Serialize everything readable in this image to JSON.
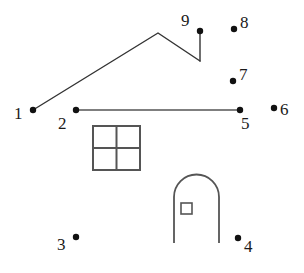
{
  "page": {
    "background_color": "#ffffff",
    "ink_color": "#333333",
    "label_color": "#1a1a1a",
    "width": 304,
    "height": 273
  },
  "dots": [
    {
      "number": "1",
      "cx": 33,
      "cy": 110,
      "r": 3.2,
      "label_x": 14,
      "label_y": 105
    },
    {
      "number": "2",
      "cx": 76,
      "cy": 110,
      "r": 3.2,
      "label_x": 58,
      "label_y": 115
    },
    {
      "number": "3",
      "cx": 76,
      "cy": 237,
      "r": 3.2,
      "label_x": 57,
      "label_y": 236
    },
    {
      "number": "4",
      "cx": 238,
      "cy": 238,
      "r": 3.2,
      "label_x": 244,
      "label_y": 238
    },
    {
      "number": "5",
      "cx": 240,
      "cy": 110,
      "r": 3.2,
      "label_x": 241,
      "label_y": 115
    },
    {
      "number": "6",
      "cx": 274,
      "cy": 108,
      "r": 3.2,
      "label_x": 280,
      "label_y": 101
    },
    {
      "number": "7",
      "cx": 233,
      "cy": 81,
      "r": 3.2,
      "label_x": 239,
      "label_y": 66
    },
    {
      "number": "8",
      "cx": 234,
      "cy": 29,
      "r": 3.2,
      "label_x": 240,
      "label_y": 14
    },
    {
      "number": "9",
      "cx": 200,
      "cy": 31,
      "r": 3.2,
      "label_x": 181,
      "label_y": 12
    }
  ],
  "lines": [
    {
      "name": "roof-line",
      "points": "33,110 158,33 200,61"
    },
    {
      "name": "base-line",
      "points": "76,110 240,110"
    },
    {
      "name": "chimney-line",
      "points": "200,61 200,31"
    }
  ],
  "window": {
    "x": 93,
    "y": 126,
    "width": 47,
    "height": 44,
    "mullion_x": 116.5,
    "mullion_y": 148
  },
  "door": {
    "path": "M 174 243 L 174 197 A 22.5 22.5 0 0 1 219 197 L 219 243",
    "knob": {
      "x": 181,
      "y": 203,
      "width": 11,
      "height": 11
    }
  }
}
